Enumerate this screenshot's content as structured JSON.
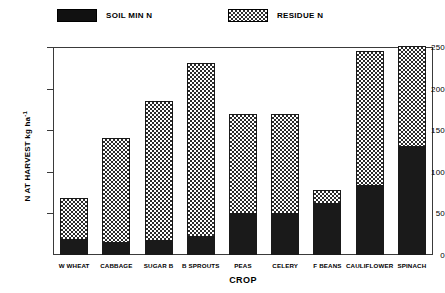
{
  "legend": {
    "items": [
      {
        "label": "SOIL MIN N",
        "swatch": "solid-black-swatch",
        "color": "#111111"
      },
      {
        "label": "RESIDUE N",
        "swatch": "checkered-swatch",
        "color": "#303030"
      }
    ]
  },
  "chart_data": {
    "type": "bar",
    "subtype": "stacked",
    "title": "",
    "xlabel": "CROP",
    "ylabel": "N AT HARVEST kg ha-1",
    "ylabel_base": "N AT HARVEST kg ha",
    "ylabel_exponent": "-1",
    "ylim": [
      0,
      250
    ],
    "yticks": [
      0,
      50,
      100,
      150,
      200,
      250
    ],
    "ytick_labels": [
      "0",
      "50",
      "100",
      "150",
      "200",
      "250"
    ],
    "grid": false,
    "legend_position": "top",
    "categories": [
      "W WHEAT",
      "CABBAGE",
      "SUGAR B",
      "B SPROUTS",
      "PEAS",
      "CELERY",
      "F BEANS",
      "CAULIFLOWER",
      "SPINACH"
    ],
    "series": [
      {
        "name": "SOIL MIN N",
        "values": [
          20,
          16,
          18,
          23,
          51,
          51,
          63,
          84,
          132
        ]
      },
      {
        "name": "RESIDUE N",
        "values": [
          48,
          125,
          167,
          208,
          119,
          119,
          15,
          161,
          119
        ]
      }
    ],
    "totals": [
      68,
      141,
      185,
      231,
      170,
      170,
      78,
      245,
      251
    ]
  }
}
